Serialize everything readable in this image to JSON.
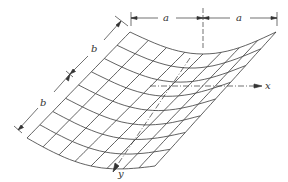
{
  "figure": {
    "colors": {
      "line": "#3a3a3a",
      "background": "#ffffff"
    },
    "grid_divisions": 8,
    "dimensions": {
      "top_left_a": "a",
      "top_right_a": "a",
      "left_upper_b": "b",
      "left_lower_b": "b"
    },
    "axes": {
      "x_label": "x",
      "y_label": "y"
    }
  }
}
